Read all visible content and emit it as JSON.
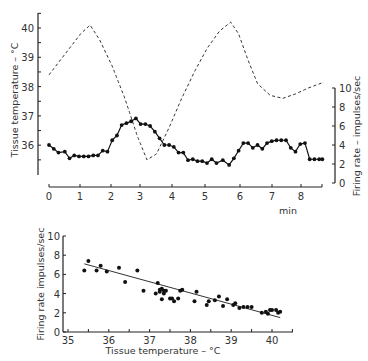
{
  "chart_data": [
    {
      "type": "line",
      "title": "",
      "xlabel": "min",
      "ylabel_left": "Tissue temperature – °C",
      "ylabel_right": "Firing rate – impulses/sec",
      "xlim": [
        0,
        8.7
      ],
      "ylim_left": [
        35,
        40.5
      ],
      "ylim_right": [
        0,
        10
      ],
      "x_ticks": [
        "0",
        "1",
        "2",
        "3",
        "4",
        "5",
        "6",
        "7",
        "8"
      ],
      "y_ticks_left": [
        "36",
        "37",
        "38",
        "39",
        "40"
      ],
      "y_ticks_right": [
        "0",
        "2",
        "4",
        "6",
        "8",
        "10"
      ],
      "series": [
        {
          "name": "Tissue temperature",
          "axis": "left",
          "style": "dashed",
          "x": [
            0,
            0.5,
            1.0,
            1.3,
            1.6,
            2.0,
            2.4,
            2.8,
            3.1,
            3.4,
            3.8,
            4.2,
            4.6,
            5.0,
            5.4,
            5.75,
            6.0,
            6.3,
            6.6,
            7.0,
            7.4,
            7.8,
            8.2,
            8.7
          ],
          "values": [
            38.4,
            39.1,
            39.8,
            40.1,
            39.6,
            38.7,
            37.6,
            36.3,
            35.5,
            35.7,
            36.6,
            37.6,
            38.5,
            39.3,
            39.9,
            40.2,
            39.8,
            38.9,
            38.1,
            37.7,
            37.6,
            37.75,
            37.95,
            38.15
          ]
        },
        {
          "name": "Firing rate",
          "axis": "right",
          "style": "solid-markers",
          "x": [
            0,
            0.15,
            0.3,
            0.5,
            0.65,
            0.8,
            0.95,
            1.1,
            1.25,
            1.4,
            1.55,
            1.7,
            1.85,
            2.0,
            2.15,
            2.3,
            2.45,
            2.6,
            2.75,
            2.9,
            3.05,
            3.2,
            3.35,
            3.5,
            3.65,
            3.8,
            3.95,
            4.1,
            4.25,
            4.4,
            4.55,
            4.7,
            4.85,
            5.0,
            5.15,
            5.3,
            5.5,
            5.7,
            5.85,
            6.0,
            6.15,
            6.3,
            6.45,
            6.6,
            6.75,
            6.9,
            7.05,
            7.2,
            7.35,
            7.5,
            7.65,
            7.8,
            7.95,
            8.1,
            8.25,
            8.4,
            8.55,
            8.65
          ],
          "values": [
            4.0,
            3.6,
            3.2,
            3.3,
            2.6,
            2.9,
            2.8,
            2.8,
            2.8,
            2.9,
            2.9,
            3.4,
            3.3,
            4.5,
            5.0,
            6.1,
            6.3,
            6.5,
            6.8,
            6.2,
            6.2,
            6.0,
            5.4,
            4.7,
            4.0,
            4.0,
            3.8,
            3.2,
            3.2,
            2.4,
            2.5,
            2.3,
            2.3,
            2.1,
            2.5,
            2.1,
            2.4,
            1.9,
            2.6,
            3.4,
            4.2,
            4.2,
            3.7,
            4.0,
            3.6,
            4.2,
            4.4,
            4.5,
            4.5,
            4.5,
            3.7,
            3.3,
            4.1,
            4.2,
            2.5,
            2.5,
            2.5,
            2.5
          ]
        }
      ]
    },
    {
      "type": "scatter",
      "title": "",
      "xlabel": "Tissue temperature – °C",
      "ylabel": "Firing rate impulses/sec",
      "xlim": [
        35,
        40.5
      ],
      "ylim": [
        0,
        10
      ],
      "x_ticks": [
        "35",
        "36",
        "37",
        "38",
        "39",
        "40"
      ],
      "y_ticks": [
        "0",
        "2",
        "4",
        "6",
        "8",
        "10"
      ],
      "regression_line": {
        "x": [
          35.4,
          40.2
        ],
        "y": [
          7.1,
          1.5
        ]
      },
      "points": [
        [
          35.4,
          6.4
        ],
        [
          35.5,
          7.4
        ],
        [
          35.7,
          6.4
        ],
        [
          35.8,
          6.9
        ],
        [
          35.95,
          6.3
        ],
        [
          36.25,
          6.7
        ],
        [
          36.4,
          5.2
        ],
        [
          36.7,
          6.4
        ],
        [
          36.85,
          4.3
        ],
        [
          37.15,
          4.0
        ],
        [
          37.2,
          5.1
        ],
        [
          37.25,
          4.4
        ],
        [
          37.25,
          4.2
        ],
        [
          37.3,
          3.4
        ],
        [
          37.3,
          4.5
        ],
        [
          37.35,
          4.0
        ],
        [
          37.35,
          4.3
        ],
        [
          37.4,
          4.3
        ],
        [
          37.5,
          3.5
        ],
        [
          37.55,
          3.5
        ],
        [
          37.6,
          3.2
        ],
        [
          37.7,
          3.5
        ],
        [
          37.75,
          4.3
        ],
        [
          37.8,
          4.4
        ],
        [
          38.1,
          3.2
        ],
        [
          38.15,
          4.2
        ],
        [
          38.4,
          2.8
        ],
        [
          38.45,
          3.2
        ],
        [
          38.6,
          3.3
        ],
        [
          38.7,
          3.7
        ],
        [
          38.8,
          2.7
        ],
        [
          38.9,
          3.4
        ],
        [
          39.05,
          2.8
        ],
        [
          39.1,
          3.0
        ],
        [
          39.2,
          2.5
        ],
        [
          39.3,
          2.6
        ],
        [
          39.4,
          2.6
        ],
        [
          39.5,
          2.6
        ],
        [
          39.75,
          2.0
        ],
        [
          39.85,
          2.1
        ],
        [
          39.9,
          1.9
        ],
        [
          39.95,
          2.3
        ],
        [
          40.0,
          2.3
        ],
        [
          40.1,
          2.3
        ],
        [
          40.15,
          2.0
        ],
        [
          40.2,
          2.1
        ]
      ]
    }
  ],
  "labels": {
    "top_ylabel_left": "Tissue temperature – °C",
    "top_ylabel_right": "Firing rate – impulses/sec",
    "top_xlabel": "min",
    "bottom_ylabel": "Firing rate impulses/sec",
    "bottom_xlabel": "Tissue temperature – °C"
  }
}
